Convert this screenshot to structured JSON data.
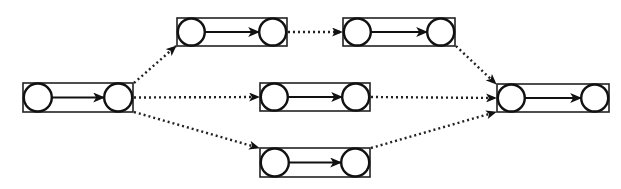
{
  "diagram": {
    "type": "activity-network",
    "colors": {
      "stroke": "#111111",
      "background": "#ffffff"
    },
    "boxes": [
      {
        "id": "A",
        "x": 23,
        "y": 83,
        "w": 110,
        "h": 29
      },
      {
        "id": "B",
        "x": 177,
        "y": 18,
        "w": 110,
        "h": 28
      },
      {
        "id": "C",
        "x": 343,
        "y": 18,
        "w": 112,
        "h": 28
      },
      {
        "id": "D",
        "x": 260,
        "y": 83,
        "w": 110,
        "h": 28
      },
      {
        "id": "E",
        "x": 260,
        "y": 148,
        "w": 110,
        "h": 29
      },
      {
        "id": "F",
        "x": 497,
        "y": 84,
        "w": 112,
        "h": 28
      }
    ],
    "dotted_links": [
      {
        "from": "A",
        "to": "B"
      },
      {
        "from": "A",
        "to": "D"
      },
      {
        "from": "A",
        "to": "E"
      },
      {
        "from": "B",
        "to": "C"
      },
      {
        "from": "C",
        "to": "F"
      },
      {
        "from": "D",
        "to": "F"
      },
      {
        "from": "E",
        "to": "F"
      }
    ]
  }
}
